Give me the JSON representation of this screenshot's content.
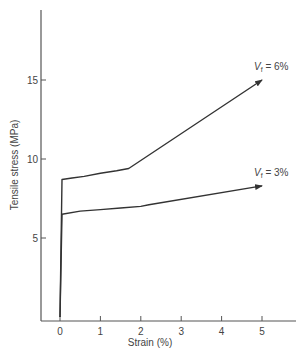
{
  "chart_data": {
    "type": "line",
    "title": "",
    "xlabel": "Strain (%)",
    "ylabel": "Tensile stress (MPa)",
    "xlim": [
      -0.45,
      5.75
    ],
    "ylim": [
      0,
      19.5
    ],
    "x_ticks": [
      0,
      1,
      2,
      3,
      4,
      5
    ],
    "y_ticks": [
      5,
      10,
      15
    ],
    "grid": false,
    "legend": "inline labels at line ends",
    "series": [
      {
        "name": "Vf = 6%",
        "label_main": "V",
        "label_sub": "f",
        "label_rest": " = 6%",
        "points": [
          [
            0,
            0
          ],
          [
            0.05,
            8.7
          ],
          [
            0.3,
            8.8
          ],
          [
            0.6,
            8.9
          ],
          [
            1.0,
            9.1
          ],
          [
            1.4,
            9.25
          ],
          [
            1.7,
            9.4
          ],
          [
            5.0,
            15.0
          ]
        ],
        "arrow_end": true
      },
      {
        "name": "Vf = 3%",
        "label_main": "V",
        "label_sub": "f",
        "label_rest": " = 3%",
        "points": [
          [
            0,
            0
          ],
          [
            0.05,
            6.5
          ],
          [
            0.5,
            6.7
          ],
          [
            1.0,
            6.8
          ],
          [
            1.5,
            6.9
          ],
          [
            2.0,
            7.0
          ],
          [
            2.2,
            7.1
          ],
          [
            5.0,
            8.3
          ]
        ],
        "arrow_end": true
      }
    ]
  }
}
